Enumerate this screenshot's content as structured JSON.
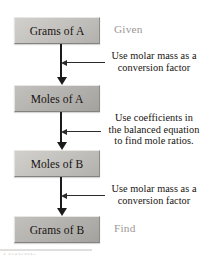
{
  "figure": {
    "background_color": "#ffffff",
    "arrow_color": "#1b1b1b",
    "box_fill_light": "#c7c5c2",
    "box_fill_dark": "#b7b5b2",
    "text_color": "#17130f",
    "side_label_color": "#9a9894"
  },
  "nodes": [
    {
      "id": "grams-a",
      "label": "Grams of A"
    },
    {
      "id": "moles-a",
      "label": "Moles of A"
    },
    {
      "id": "moles-b",
      "label": "Moles of B"
    },
    {
      "id": "grams-b",
      "label": "Grams of B"
    }
  ],
  "annotations": [
    {
      "id": "molar-mass-a",
      "lines": [
        "Use molar mass as a",
        "conversion factor"
      ]
    },
    {
      "id": "mole-ratio",
      "lines": [
        "Use coefficients in",
        "the balanced equation",
        "to find mole ratios."
      ]
    },
    {
      "id": "molar-mass-b",
      "lines": [
        "Use molar mass as a",
        "conversion factor"
      ]
    }
  ],
  "side_labels": {
    "given": "Given",
    "find": "Find"
  },
  "caption": {
    "cropped_text": "FIGURE"
  }
}
